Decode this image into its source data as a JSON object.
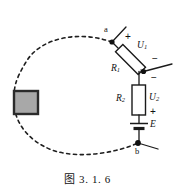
{
  "figure": {
    "caption": "图 3. 1. 6",
    "background_color": "#ffffff",
    "ink_color": "#1a1a1a",
    "block_fill_color": "#a8a8a8",
    "block_border_color": "#2b2b2b"
  },
  "nodes": {
    "a": "a",
    "b": "b"
  },
  "components": {
    "r1": "R",
    "r1_sub": "1",
    "r2": "R",
    "r2_sub": "2",
    "u1": "U",
    "u1_sub": "1",
    "u2": "U",
    "u2_sub": "2",
    "emf": "E"
  },
  "polarity": {
    "u1_plus": "+",
    "u1_minus": "−",
    "u2_minus": "−",
    "u2_plus": "+"
  },
  "icons": {
    "resistor_r1": "resistor-icon",
    "resistor_r2": "resistor-icon",
    "battery": "battery-cell-icon",
    "node_a": "junction-dot-icon",
    "node_mid": "junction-dot-icon",
    "node_b": "junction-dot-icon",
    "load_block": "black-box-load-icon",
    "loop_path": "dashed-loop-icon"
  }
}
